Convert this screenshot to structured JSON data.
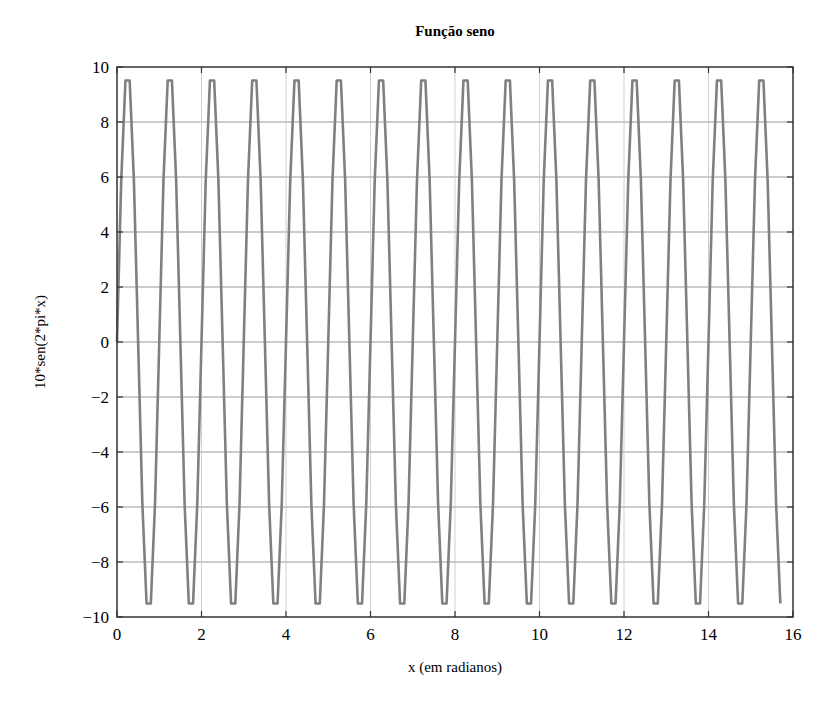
{
  "chart_data": {
    "type": "line",
    "title": "Função seno",
    "xlabel": "x (em radianos)",
    "ylabel": "10*sen(2*pi*x)",
    "xlim": [
      0,
      16
    ],
    "ylim": [
      -10,
      10
    ],
    "xticks": [
      0,
      2,
      4,
      6,
      8,
      10,
      12,
      14,
      16
    ],
    "yticks": [
      -10,
      -8,
      -6,
      -4,
      -2,
      0,
      2,
      4,
      6,
      8,
      10
    ],
    "xtick_labels": [
      "0",
      "2",
      "4",
      "6",
      "8",
      "10",
      "12",
      "14",
      "16"
    ],
    "ytick_labels": [
      "−10",
      "−8",
      "−6",
      "−4",
      "−2",
      "0",
      "2",
      "4",
      "6",
      "8",
      "10"
    ],
    "grid": true,
    "legend": null,
    "series": [
      {
        "name": "10*sen(2*pi*x)",
        "function": "10*sin(2*pi*x)",
        "x_start": 0,
        "x_end": 15.7,
        "x_step": 0.1,
        "color": "#808080"
      }
    ]
  },
  "colors": {
    "curve": "#808080",
    "axes": "#333333",
    "grid": "#9a9a9a"
  }
}
